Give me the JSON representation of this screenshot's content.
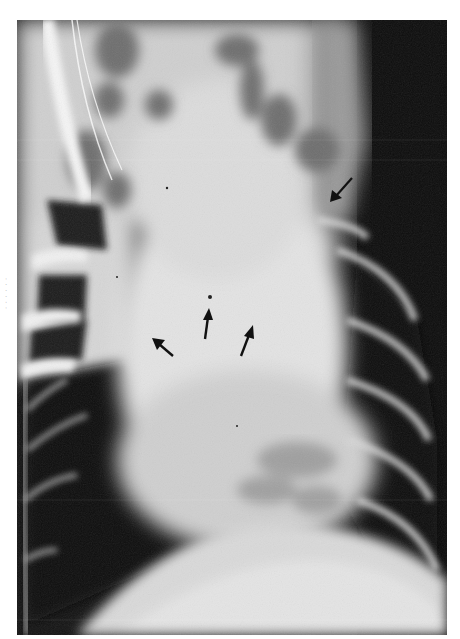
{
  "figure": {
    "type": "radiograph",
    "view": "ventrodorsal thoracic radiograph",
    "margin_marker": "· · · · · ·",
    "annotations": {
      "arrows": [
        {
          "id": "arrow-upper-right",
          "x": 336,
          "y": 180,
          "direction": "down-left"
        },
        {
          "id": "arrow-left",
          "x": 160,
          "y": 340,
          "direction": "up-left"
        },
        {
          "id": "arrow-center",
          "x": 206,
          "y": 320,
          "direction": "up"
        },
        {
          "id": "arrow-right",
          "x": 246,
          "y": 340,
          "direction": "up-right"
        }
      ]
    },
    "tones": {
      "background": "#ffffff",
      "lung_dark": "#111111",
      "soft_tissue": "#cfcfcf",
      "cardiac_silhouette": "#e2e2e2",
      "bone": "#f2f2f2",
      "arrow": "#111111"
    }
  }
}
